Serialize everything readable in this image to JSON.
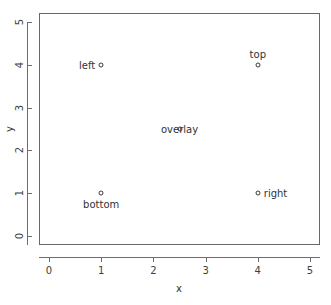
{
  "chart_data": {
    "type": "scatter",
    "title": "",
    "xlabel": "x",
    "ylabel": "y",
    "xlim": [
      0,
      5
    ],
    "ylim": [
      0,
      5
    ],
    "grid": false,
    "legend": "none",
    "marker": "open-circle",
    "xticks": [
      "0",
      "1",
      "2",
      "3",
      "4",
      "5"
    ],
    "yticks": [
      "0",
      "1",
      "2",
      "3",
      "4",
      "5"
    ],
    "xtick_values": [
      0,
      1,
      2,
      3,
      4,
      5
    ],
    "ytick_values": [
      0,
      1,
      2,
      3,
      4,
      5
    ],
    "points": [
      {
        "label": "bottom",
        "x": 1,
        "y": 1,
        "label_position": "below"
      },
      {
        "label": "left",
        "x": 1,
        "y": 4,
        "label_position": "left"
      },
      {
        "label": "top",
        "x": 4,
        "y": 4,
        "label_position": "above"
      },
      {
        "label": "right",
        "x": 4,
        "y": 1,
        "label_position": "right"
      },
      {
        "label": "overlay",
        "x": 2.5,
        "y": 2.5,
        "label_position": "center"
      }
    ],
    "x": [
      1,
      1,
      4,
      4,
      2.5
    ],
    "y": [
      1,
      4,
      4,
      1,
      2.5
    ],
    "labels": [
      "bottom",
      "left",
      "top",
      "right",
      "overlay"
    ],
    "colors": {
      "marker_stroke": "#3a3e40",
      "axis": "#6a6e70",
      "frame": "#666a6c",
      "text": "#2f3335",
      "background": "#ffffff"
    }
  }
}
